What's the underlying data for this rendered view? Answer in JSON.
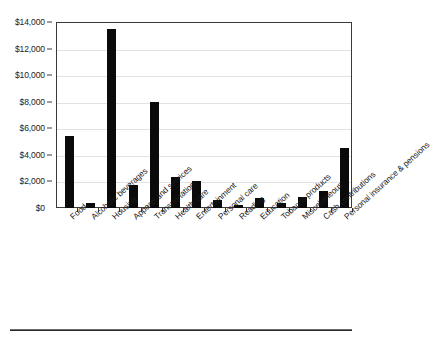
{
  "chart_data": {
    "type": "bar",
    "title": "",
    "subtitle": "",
    "xlabel": "",
    "ylabel": "",
    "categories": [
      "Food",
      "Alcoholic beverages",
      "Housing",
      "Apparel and services",
      "Transportation",
      "Health care",
      "Entertainment",
      "Personal care",
      "Reading",
      "Education",
      "Tobacco products",
      "Miscellaneous",
      "Cash contributions",
      "Personal insurance & pensions"
    ],
    "values": [
      5450,
      400,
      13500,
      1750,
      7950,
      2300,
      2050,
      600,
      190,
      750,
      350,
      800,
      1270,
      4550
    ],
    "ylim": [
      0,
      14000
    ],
    "ytick_values": [
      0,
      2000,
      4000,
      6000,
      8000,
      10000,
      12000,
      14000
    ],
    "ytick_labels": [
      "$0",
      "$2,000",
      "$4,000",
      "$6,000",
      "$8,000",
      "$10,000",
      "$12,000",
      "$14,000"
    ],
    "grid": true,
    "legend": "none",
    "bar_color": "#0a0a0a",
    "gridline_color": "#e2e2e2",
    "axis_color": "#3a3a3a",
    "xtick_label_rotation": -42
  }
}
